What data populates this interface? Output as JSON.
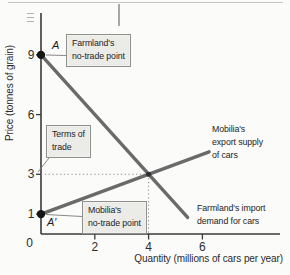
{
  "chart_data": {
    "type": "line",
    "title": "",
    "xlabel": "Quantity (millions of cars per year)",
    "ylabel": "Price (tonnes of grain)",
    "xlim": [
      0,
      8.9
    ],
    "ylim": [
      0,
      11.1
    ],
    "x_ticks": [
      2,
      4,
      6
    ],
    "x_origin_label": "0",
    "y_ticks": [
      1,
      3,
      6,
      9
    ],
    "grid": false,
    "legend": "none",
    "series": [
      {
        "name": "Farmland's import demand for cars",
        "role": "import-demand",
        "points": [
          [
            0,
            9
          ],
          [
            5.45,
            0.83
          ]
        ]
      },
      {
        "name": "Mobilia's export supply of cars",
        "role": "export-supply",
        "points": [
          [
            0,
            1
          ],
          [
            6.25,
            4.13
          ]
        ]
      }
    ],
    "equilibrium": {
      "x": 4,
      "y": 3,
      "label": "Terms of trade"
    },
    "no_trade_points": [
      {
        "label": "A",
        "x": 0,
        "y": 9,
        "description": "Farmland's no-trade point"
      },
      {
        "label": "A′",
        "x": 0,
        "y": 1,
        "description": "Mobilia's no-trade point"
      }
    ]
  },
  "labels": {
    "y_axis_title": "Price (tonnes of grain)",
    "x_axis_title": "Quantity (millions of cars per year)",
    "farmland_no_trade_box": "Farmland's\nno-trade point",
    "terms_of_trade_box": "Terms of\ntrade",
    "mobilia_no_trade_box": "Mobilia's\nno-trade point",
    "export_supply_label": "Mobilia's\nexport supply\nof cars",
    "import_demand_label": "Farmland's import\ndemand for cars",
    "point_a": "A",
    "point_a_prime": "A′"
  }
}
